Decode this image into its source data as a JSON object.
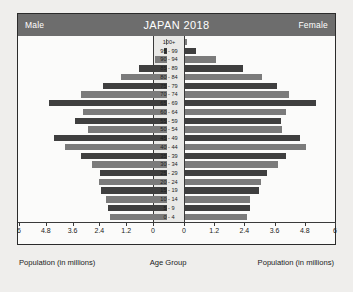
{
  "header": {
    "left_label": "Male",
    "title": "JAPAN 2018",
    "right_label": "Female"
  },
  "footer": {
    "left_axis_label": "Population (in millions)",
    "center_axis_label": "Age Group",
    "right_axis_label": "Population (in millions)"
  },
  "colors": {
    "header_bar": "#6d6d6d",
    "bar_light": "#7b7b7b",
    "bar_dark": "#3f3f3f",
    "frame": "#2b2b2b",
    "page_background": "#efeeec",
    "plot_background": "#fbfbfa",
    "center_strip": "#e9e9e7"
  },
  "chart_data": {
    "type": "bar",
    "subtype": "population-pyramid",
    "title": "JAPAN 2018",
    "xlabel": "Population (in millions)",
    "ylabel": "Age Group",
    "categories": [
      "100+",
      "95 - 99",
      "90 - 94",
      "85 - 89",
      "80 - 84",
      "75 - 79",
      "70 - 74",
      "65 - 69",
      "60 - 64",
      "55 - 59",
      "50 - 54",
      "45 - 49",
      "40 - 44",
      "35 - 39",
      "30 - 34",
      "25 - 29",
      "20 - 24",
      "15 - 19",
      "10 - 14",
      "5 - 9",
      "0 - 4"
    ],
    "series": [
      {
        "name": "Male",
        "side": "left",
        "values": [
          0.01,
          0.12,
          0.55,
          1.25,
          2.05,
          2.85,
          3.85,
          5.3,
          3.75,
          4.1,
          3.55,
          5.05,
          4.55,
          3.85,
          3.35,
          3.0,
          3.05,
          2.95,
          2.75,
          2.65,
          2.55
        ]
      },
      {
        "name": "Female",
        "side": "right",
        "values": [
          0.06,
          0.45,
          1.25,
          2.3,
          3.05,
          3.65,
          4.15,
          5.2,
          4.0,
          3.8,
          3.85,
          4.55,
          4.8,
          4.0,
          3.7,
          3.25,
          3.0,
          2.95,
          2.6,
          2.6,
          2.45
        ]
      }
    ],
    "xticks_left": [
      "6",
      "4.8",
      "3.6",
      "2.4",
      "1.2",
      "0"
    ],
    "xticks_right": [
      "0",
      "1.2",
      "2.4",
      "3.6",
      "4.8",
      "6"
    ],
    "xlim": [
      0,
      6
    ],
    "tick_interval": 1.2,
    "grid": false,
    "legend_position": "header"
  }
}
